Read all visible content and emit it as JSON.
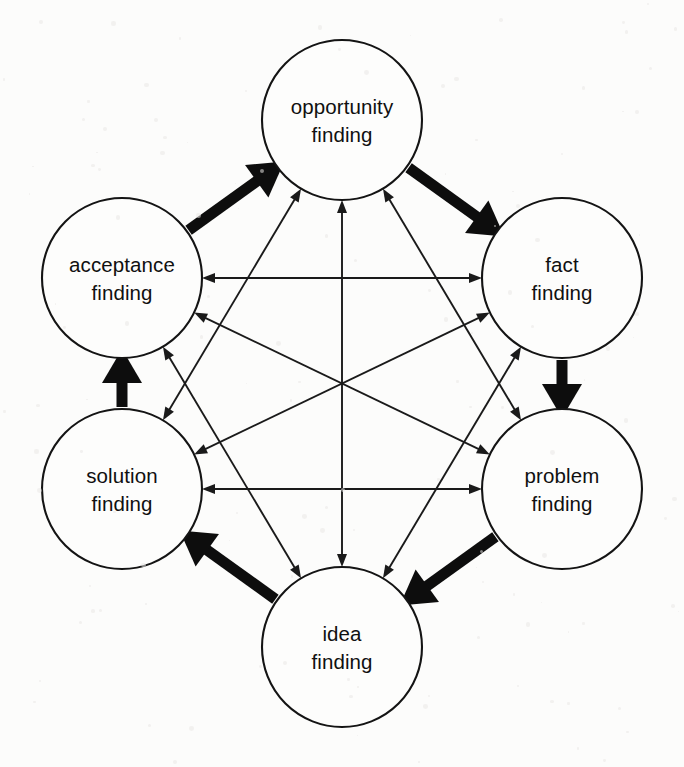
{
  "diagram": {
    "type": "cycle-diagram",
    "background_color": "#fcfcfb",
    "stroke_color": "#111111",
    "node_fill_color": "#fdfdfc",
    "canvas": {
      "width": 684,
      "height": 767
    },
    "node_radius": 80,
    "nodes": [
      {
        "id": "opportunity",
        "line1": "opportunity",
        "line2": "finding",
        "cx": 342,
        "cy": 120,
        "angle_deg": -90
      },
      {
        "id": "fact",
        "line1": "fact",
        "line2": "finding",
        "cx": 562,
        "cy": 278,
        "angle_deg": -30
      },
      {
        "id": "problem",
        "line1": "problem",
        "line2": "finding",
        "cx": 562,
        "cy": 489,
        "angle_deg": 30
      },
      {
        "id": "idea",
        "line1": "idea",
        "line2": "finding",
        "cx": 342,
        "cy": 647,
        "angle_deg": 90
      },
      {
        "id": "solution",
        "line1": "solution",
        "line2": "finding",
        "cx": 122,
        "cy": 489,
        "angle_deg": 150
      },
      {
        "id": "acceptance",
        "line1": "acceptance",
        "line2": "finding",
        "cx": 122,
        "cy": 278,
        "angle_deg": -150
      }
    ],
    "bold_edges": [
      {
        "from": "opportunity",
        "to": "fact",
        "style": "bold",
        "arrow": "single"
      },
      {
        "from": "fact",
        "to": "problem",
        "style": "bold",
        "arrow": "single"
      },
      {
        "from": "problem",
        "to": "idea",
        "style": "bold",
        "arrow": "single"
      },
      {
        "from": "idea",
        "to": "solution",
        "style": "bold",
        "arrow": "single"
      },
      {
        "from": "solution",
        "to": "acceptance",
        "style": "bold",
        "arrow": "single"
      },
      {
        "from": "acceptance",
        "to": "opportunity",
        "style": "bold",
        "arrow": "single"
      }
    ],
    "thin_edges": [
      {
        "from": "opportunity",
        "to": "problem",
        "style": "thin",
        "arrow": "double"
      },
      {
        "from": "opportunity",
        "to": "idea",
        "style": "thin",
        "arrow": "double"
      },
      {
        "from": "opportunity",
        "to": "solution",
        "style": "thin",
        "arrow": "double"
      },
      {
        "from": "fact",
        "to": "idea",
        "style": "thin",
        "arrow": "double"
      },
      {
        "from": "fact",
        "to": "solution",
        "style": "thin",
        "arrow": "double"
      },
      {
        "from": "fact",
        "to": "acceptance",
        "style": "thin",
        "arrow": "double"
      },
      {
        "from": "problem",
        "to": "solution",
        "style": "thin",
        "arrow": "double"
      },
      {
        "from": "problem",
        "to": "acceptance",
        "style": "thin",
        "arrow": "double"
      },
      {
        "from": "idea",
        "to": "acceptance",
        "style": "thin",
        "arrow": "double"
      }
    ]
  }
}
